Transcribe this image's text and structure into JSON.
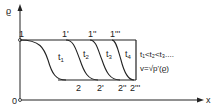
{
  "axes": {
    "y_label": "ϱ",
    "x_label": "x",
    "origin_label": "0"
  },
  "top_points": [
    "1",
    "1'",
    "1''",
    "1'''"
  ],
  "bottom_points": [
    "2",
    "2'",
    "2''",
    "2'''"
  ],
  "curves": [
    {
      "label": "t",
      "sub": "1"
    },
    {
      "label": "t",
      "sub": "2"
    },
    {
      "label": "t",
      "sub": "3"
    },
    {
      "label": "t",
      "sub": "4"
    }
  ],
  "annotation": {
    "ordering": "t₁<t₂<t₃....",
    "velocity": "v=√p'(ϱ)"
  },
  "colors": {
    "line": "#222222",
    "background": "#ffffff"
  }
}
